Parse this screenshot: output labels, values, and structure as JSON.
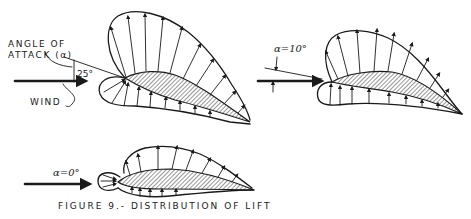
{
  "figure": {
    "caption": "FIGURE 9.- DISTRIBUTION OF LIFT",
    "diagrams": [
      {
        "id": "high-angle",
        "angle_label_line1": "ANGLE OF",
        "angle_label_line2": "ATTACK (α)",
        "angle_value": "25°",
        "wind_label": "WIND"
      },
      {
        "id": "mid-angle",
        "angle_label": "α=10°"
      },
      {
        "id": "zero-angle",
        "angle_label": "α=0°"
      }
    ]
  },
  "colors": {
    "ink": "#1a1a1a",
    "background": "#ffffff"
  }
}
